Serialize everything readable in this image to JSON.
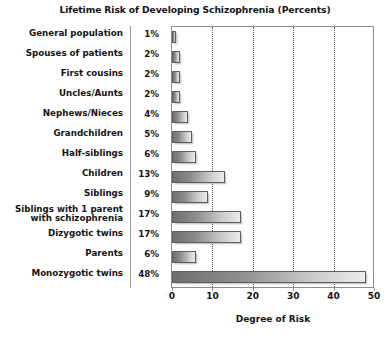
{
  "chart_data": {
    "type": "bar",
    "orientation": "horizontal",
    "title": "Lifetime Risk of Developing Schizophrenia (Percents)",
    "xlabel": "Degree of Risk",
    "ylabel": "",
    "xlim": [
      0,
      50
    ],
    "xticks": [
      0,
      10,
      20,
      30,
      40,
      50
    ],
    "xtick_labels": [
      "0",
      "10",
      "20",
      "30",
      "40",
      "50"
    ],
    "gridlines": [
      10,
      20,
      30,
      40
    ],
    "grid": true,
    "legend": false,
    "categories": [
      "General population",
      "Spouses of patients",
      "First cousins",
      "Uncles/Aunts",
      "Nephews/Nieces",
      "Grandchildren",
      "Half-siblings",
      "Children",
      "Siblings",
      "Siblings with 1 parent\nwith schizophrenia",
      "Dizygotic twins",
      "Parents",
      "Monozygotic twins"
    ],
    "values": [
      1,
      2,
      2,
      2,
      4,
      5,
      6,
      13,
      9,
      17,
      17,
      6,
      48
    ],
    "value_labels": [
      "1%",
      "2%",
      "2%",
      "2%",
      "4%",
      "5%",
      "6%",
      "13%",
      "9%",
      "17%",
      "17%",
      "6%",
      "48%"
    ],
    "bar_fill_start": "#6f6f6f",
    "bar_fill_end": "#ececec",
    "bar_border": "#5e5e5e",
    "frame_color": "#8d8d8d",
    "gridline_color": "#555555",
    "text_color": "#141414",
    "background": "#ffffff"
  }
}
